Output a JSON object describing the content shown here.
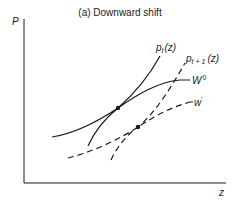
{
  "diagram": {
    "title": "(a) Downward shift",
    "y_axis_label": "P",
    "x_axis_label": "z",
    "curves": [
      {
        "id": "p_t",
        "label_main": "p",
        "label_sub": "t",
        "label_suffix": "(z)",
        "style": "solid"
      },
      {
        "id": "p_t1",
        "label_main": "p",
        "label_sub": "t + 1",
        "label_suffix": "(z)",
        "style": "dashed"
      },
      {
        "id": "W0",
        "label_main": "W",
        "label_sup": "0",
        "style": "solid"
      },
      {
        "id": "w_prime",
        "label_main": "w",
        "label_sup": "'",
        "style": "dashed"
      }
    ],
    "points": [
      {
        "id": "eq-initial",
        "description": "intersection of p_t(z) and W0"
      },
      {
        "id": "eq-shifted",
        "description": "intersection of p_t+1(z) and w'"
      }
    ],
    "colors": {
      "ink": "#1a1a1a",
      "background": "#ffffff"
    }
  }
}
